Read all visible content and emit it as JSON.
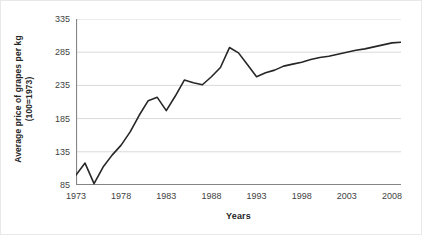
{
  "chart_data": {
    "type": "line",
    "title": "",
    "xlabel": "Years",
    "ylabel": "Average price of grapes per kg (100=1973)",
    "ylabel_line1": "Average price of grapes per kg",
    "ylabel_line2": "(100=1973)",
    "xlim": [
      1973,
      2009
    ],
    "ylim": [
      85,
      335
    ],
    "yticks": [
      85,
      135,
      185,
      235,
      285,
      335
    ],
    "xticks": [
      1973,
      1978,
      1983,
      1988,
      1993,
      1998,
      2003,
      2008
    ],
    "grid": "horizontal",
    "legend": "none",
    "series_color": "#262626",
    "grid_color": "#d9d9d9",
    "axis_color": "#868686",
    "x": [
      1973,
      1974,
      1975,
      1976,
      1977,
      1978,
      1979,
      1980,
      1981,
      1982,
      1983,
      1984,
      1985,
      1986,
      1987,
      1988,
      1989,
      1990,
      1991,
      1992,
      1993,
      1994,
      1995,
      1996,
      1997,
      1998,
      1999,
      2000,
      2001,
      2002,
      2003,
      2004,
      2005,
      2006,
      2007,
      2008,
      2009
    ],
    "values": [
      100,
      118,
      87,
      112,
      130,
      145,
      165,
      190,
      212,
      217,
      197,
      219,
      243,
      239,
      236,
      248,
      262,
      292,
      284,
      266,
      248,
      254,
      258,
      264,
      267,
      270,
      274,
      277,
      279,
      282,
      285,
      288,
      290,
      293,
      296,
      299,
      300
    ]
  },
  "figure": {
    "xaxis_title": "Years"
  }
}
